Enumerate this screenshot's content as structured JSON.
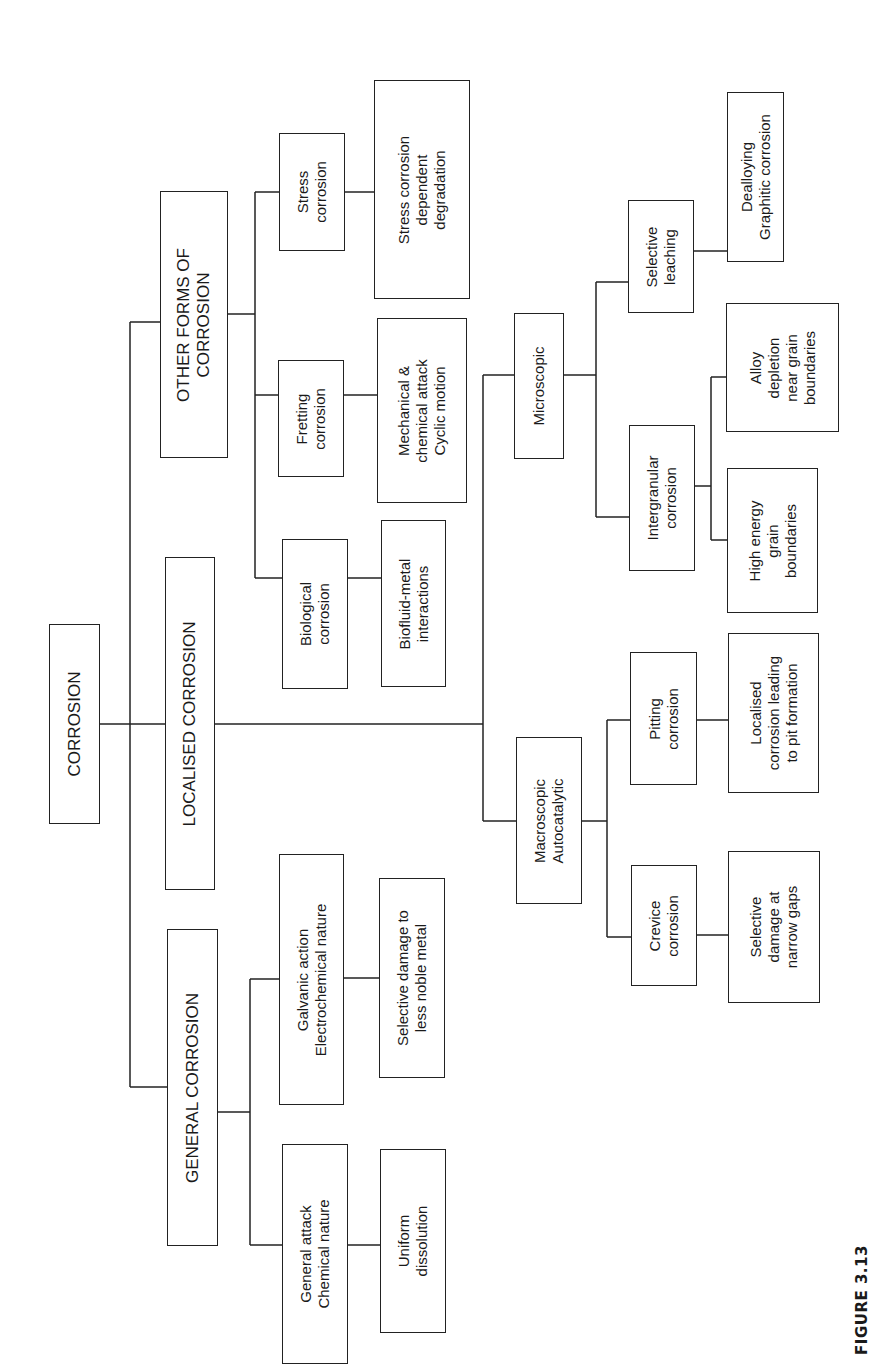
{
  "figure": {
    "caption": "FIGURE 3.13",
    "orientation": "rotated -90deg (landscape tree printed sideways)"
  },
  "nodes": [
    {
      "id": "corrosion",
      "label": "CORROSION",
      "x": 49,
      "y": 624,
      "w": 51,
      "h": 200,
      "size": "l"
    },
    {
      "id": "other-forms",
      "label": "OTHER FORMS OF\nCORROSION",
      "x": 160,
      "y": 191,
      "w": 68,
      "h": 267,
      "size": "l"
    },
    {
      "id": "localised",
      "label": "LOCALISED CORROSION",
      "x": 165,
      "y": 557,
      "w": 50,
      "h": 333,
      "size": "l"
    },
    {
      "id": "general",
      "label": "GENERAL CORROSION",
      "x": 167,
      "y": 929,
      "w": 51,
      "h": 317,
      "size": "l"
    },
    {
      "id": "stress",
      "label": "Stress\ncorrosion",
      "x": 279,
      "y": 133,
      "w": 66,
      "h": 118,
      "size": "m"
    },
    {
      "id": "fretting",
      "label": "Fretting\ncorrosion",
      "x": 278,
      "y": 360,
      "w": 66,
      "h": 117,
      "size": "m"
    },
    {
      "id": "biological",
      "label": "Biological\ncorrosion",
      "x": 282,
      "y": 539,
      "w": 66,
      "h": 150,
      "size": "m"
    },
    {
      "id": "stress-desc",
      "label": "Stress corrosion\ndependent\ndegradation",
      "x": 374,
      "y": 80,
      "w": 96,
      "h": 219,
      "size": "m"
    },
    {
      "id": "fretting-desc",
      "label": "Mechanical &\nchemical attack\nCyclic motion",
      "x": 377,
      "y": 318,
      "w": 90,
      "h": 185,
      "size": "m"
    },
    {
      "id": "biological-desc",
      "label": "Biofluid-metal\ninteractions",
      "x": 381,
      "y": 520,
      "w": 65,
      "h": 167,
      "size": "m"
    },
    {
      "id": "galvanic",
      "label": "Galvanic action\nElectrochemical nature",
      "x": 279,
      "y": 854,
      "w": 65,
      "h": 251,
      "size": "m"
    },
    {
      "id": "general-attack",
      "label": "General attack\nChemical nature",
      "x": 282,
      "y": 1144,
      "w": 66,
      "h": 220,
      "size": "m"
    },
    {
      "id": "galvanic-desc",
      "label": "Selective damage to\nless noble metal",
      "x": 379,
      "y": 878,
      "w": 66,
      "h": 200,
      "size": "m"
    },
    {
      "id": "uniform-desc",
      "label": "Uniform\ndissolution",
      "x": 380,
      "y": 1149,
      "w": 66,
      "h": 184,
      "size": "m"
    },
    {
      "id": "microscopic",
      "label": "Microscopic",
      "x": 514,
      "y": 313,
      "w": 50,
      "h": 146,
      "size": "m"
    },
    {
      "id": "macroscopic",
      "label": "Macroscopic\nAutocatalytic",
      "x": 516,
      "y": 737,
      "w": 66,
      "h": 167,
      "size": "m"
    },
    {
      "id": "selective-leaching",
      "label": "Selective\nleaching",
      "x": 628,
      "y": 200,
      "w": 66,
      "h": 113,
      "size": "m"
    },
    {
      "id": "intergranular",
      "label": "Intergranular\ncorrosion",
      "x": 629,
      "y": 425,
      "w": 66,
      "h": 146,
      "size": "m"
    },
    {
      "id": "pitting",
      "label": "Pitting\ncorrosion",
      "x": 630,
      "y": 652,
      "w": 67,
      "h": 133,
      "size": "m"
    },
    {
      "id": "crevice",
      "label": "Crevice\ncorrosion",
      "x": 631,
      "y": 865,
      "w": 66,
      "h": 121,
      "size": "m"
    },
    {
      "id": "dealloying-desc",
      "label": "Dealloying\nGraphitic corrosion",
      "x": 727,
      "y": 92,
      "w": 57,
      "h": 170,
      "size": "m"
    },
    {
      "id": "alloy-depletion-desc",
      "label": "Alloy\ndepletion\nnear grain\nboundaries",
      "x": 726,
      "y": 303,
      "w": 113,
      "h": 129,
      "size": "m"
    },
    {
      "id": "high-energy-desc",
      "label": "High energy\ngrain\nboundaries",
      "x": 727,
      "y": 468,
      "w": 91,
      "h": 145,
      "size": "m"
    },
    {
      "id": "pitting-desc",
      "label": "Localised\ncorrosion leading\nto pit formation",
      "x": 728,
      "y": 633,
      "w": 91,
      "h": 160,
      "size": "m"
    },
    {
      "id": "crevice-desc",
      "label": "Selective\ndamage at\nnarrow gaps",
      "x": 728,
      "y": 851,
      "w": 92,
      "h": 152,
      "size": "m"
    }
  ],
  "connectors": [
    [
      100,
      724,
      130,
      724
    ],
    [
      130,
      322,
      130,
      1087
    ],
    [
      130,
      322,
      160,
      322
    ],
    [
      130,
      724,
      165,
      724
    ],
    [
      130,
      1087,
      167,
      1087
    ],
    [
      228,
      314,
      255,
      314
    ],
    [
      255,
      192,
      255,
      578
    ],
    [
      255,
      192,
      279,
      192
    ],
    [
      255,
      395,
      278,
      395
    ],
    [
      255,
      578,
      282,
      578
    ],
    [
      345,
      192,
      374,
      192
    ],
    [
      344,
      395,
      377,
      395
    ],
    [
      348,
      578,
      381,
      578
    ],
    [
      218,
      1112,
      250,
      1112
    ],
    [
      250,
      979,
      250,
      1245
    ],
    [
      250,
      979,
      279,
      979
    ],
    [
      250,
      1245,
      282,
      1245
    ],
    [
      344,
      978,
      379,
      978
    ],
    [
      348,
      1245,
      380,
      1245
    ],
    [
      215,
      724,
      483,
      724
    ],
    [
      483,
      375,
      483,
      821
    ],
    [
      483,
      375,
      514,
      375
    ],
    [
      483,
      821,
      516,
      821
    ],
    [
      564,
      375,
      596,
      375
    ],
    [
      596,
      282,
      596,
      517
    ],
    [
      596,
      282,
      628,
      282
    ],
    [
      596,
      517,
      629,
      517
    ],
    [
      694,
      251,
      727,
      251
    ],
    [
      695,
      486,
      711,
      486
    ],
    [
      711,
      377,
      711,
      540
    ],
    [
      711,
      377,
      726,
      377
    ],
    [
      711,
      540,
      727,
      540
    ],
    [
      582,
      821,
      607,
      821
    ],
    [
      607,
      720,
      607,
      937
    ],
    [
      607,
      720,
      630,
      720
    ],
    [
      607,
      937,
      631,
      937
    ],
    [
      697,
      720,
      728,
      720
    ],
    [
      697,
      935,
      728,
      935
    ]
  ],
  "colors": {
    "line": "#222222",
    "text": "#1a1a1a",
    "background": "#ffffff"
  }
}
